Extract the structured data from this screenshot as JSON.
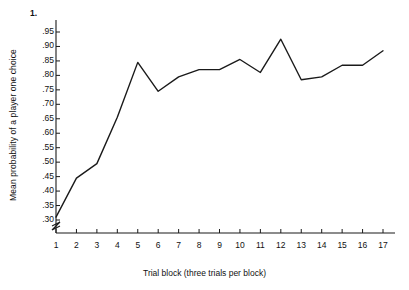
{
  "chart_data": {
    "type": "line",
    "title": "",
    "xlabel": "Trial block (three trials per block)",
    "ylabel": "Mean probability of a player one choice",
    "x": [
      1,
      2,
      3,
      4,
      5,
      6,
      7,
      8,
      9,
      10,
      11,
      12,
      13,
      14,
      15,
      16,
      17
    ],
    "values": [
      0.31,
      0.445,
      0.495,
      0.655,
      0.845,
      0.745,
      0.795,
      0.82,
      0.82,
      0.855,
      0.81,
      0.925,
      0.785,
      0.795,
      0.835,
      0.835,
      0.885
    ],
    "series": [
      {
        "name": "Mean probability of a player one choice",
        "values": [
          0.31,
          0.445,
          0.495,
          0.655,
          0.845,
          0.745,
          0.795,
          0.82,
          0.82,
          0.855,
          0.81,
          0.925,
          0.785,
          0.795,
          0.835,
          0.835,
          0.885
        ]
      }
    ],
    "xtick_labels": [
      "1",
      "2",
      "3",
      "4",
      "5",
      "6",
      "7",
      "8",
      "9",
      "10",
      "11",
      "12",
      "13",
      "14",
      "15",
      "16",
      "17"
    ],
    "ytick_labels": [
      ".95",
      ".90",
      ".85",
      ".80",
      ".75",
      ".70",
      ".65",
      ".60",
      ".55",
      ".50",
      ".45",
      ".40",
      ".35",
      ".30"
    ],
    "ytick_values": [
      0.95,
      0.9,
      0.85,
      0.8,
      0.75,
      0.7,
      0.65,
      0.6,
      0.55,
      0.5,
      0.45,
      0.4,
      0.35,
      0.3
    ],
    "y_axis_top_label": "1.",
    "ylim": [
      0.3,
      0.95
    ],
    "xlim": [
      1,
      17
    ],
    "grid": false,
    "legend": "none",
    "axis_break": true,
    "line_color": "#1a1a1a",
    "axis_color": "#1a1a1a",
    "background_color": "#ffffff"
  }
}
